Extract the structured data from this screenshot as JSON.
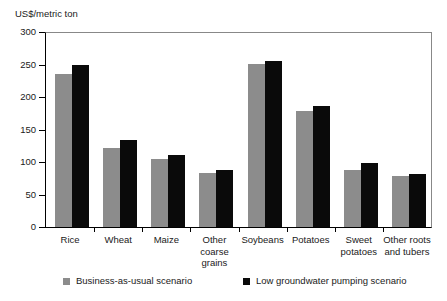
{
  "chart_data": {
    "type": "bar",
    "title": "",
    "subtitle": "",
    "xlabel": "",
    "ylabel": "US$/metric ton",
    "ylim": [
      0,
      300
    ],
    "yticks": [
      0,
      50,
      100,
      150,
      200,
      250,
      300
    ],
    "ytick_labels": [
      "0",
      "50",
      "100",
      "150",
      "200",
      "250",
      "300"
    ],
    "grid": false,
    "legend_position": "bottom",
    "categories": [
      "Rice",
      "Wheat",
      "Maize",
      "Other coarse grains",
      "Soybeans",
      "Potatoes",
      "Sweet potatoes",
      "Other roots and tubers"
    ],
    "category_labels": [
      [
        "Rice"
      ],
      [
        "Wheat"
      ],
      [
        "Maize"
      ],
      [
        "Other",
        "coarse",
        "grains"
      ],
      [
        "Soybeans"
      ],
      [
        "Potatoes"
      ],
      [
        "Sweet",
        "potatoes"
      ],
      [
        "Other roots",
        "and tubers"
      ]
    ],
    "series": [
      {
        "name": "Business-as-usual scenario",
        "color": "#8c8c8c",
        "values": [
          235,
          121,
          105,
          83,
          251,
          179,
          88,
          78
        ]
      },
      {
        "name": "Low groundwater pumping scenario",
        "color": "#0a0a0a",
        "values": [
          249,
          134,
          111,
          88,
          256,
          186,
          98,
          82
        ]
      }
    ]
  },
  "legend": {
    "items": [
      {
        "label": "Business-as-usual scenario",
        "color": "#8c8c8c"
      },
      {
        "label": "Low groundwater pumping scenario",
        "color": "#0a0a0a"
      }
    ]
  }
}
